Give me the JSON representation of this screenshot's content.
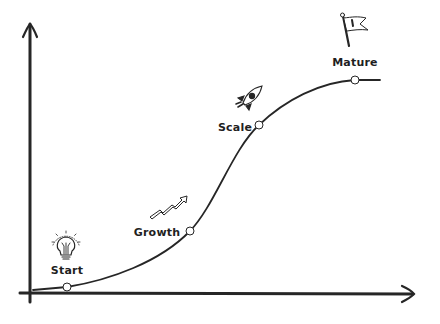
{
  "diagram": {
    "type": "s-curve-lifecycle",
    "colors": {
      "line": "#262626",
      "point_fill": "#ffffff",
      "background": "#ffffff"
    },
    "axes": {
      "x_axis": {
        "has_arrow": true,
        "label": ""
      },
      "y_axis": {
        "has_arrow": true,
        "label": ""
      }
    },
    "stages": [
      {
        "id": "start",
        "label": "Start",
        "icon": "lightbulb-icon",
        "point": [
          67,
          287
        ],
        "label_pos": [
          67,
          270
        ]
      },
      {
        "id": "growth",
        "label": "Growth",
        "icon": "trend-arrow-icon",
        "point": [
          190,
          231
        ],
        "label_pos": [
          157,
          232
        ]
      },
      {
        "id": "scale",
        "label": "Scale",
        "icon": "rocket-icon",
        "point": [
          259,
          125
        ],
        "label_pos": [
          235,
          127
        ]
      },
      {
        "id": "mature",
        "label": "Mature",
        "icon": "flag-icon",
        "point": [
          355,
          80
        ],
        "label_pos": [
          355,
          62
        ]
      }
    ]
  }
}
